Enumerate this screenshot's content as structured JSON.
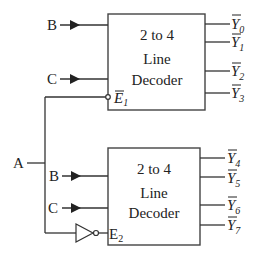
{
  "diagram": {
    "inputs": {
      "A": "A",
      "B_top": "B",
      "C_top": "C",
      "B_bottom": "B",
      "C_bottom": "C"
    },
    "decoder_top": {
      "line1": "2  to 4",
      "line2": "Line",
      "line3": "Decoder",
      "enable_label": "E",
      "enable_sub": "1",
      "enable_active_low": true,
      "outputs": [
        {
          "name": "Y",
          "sub": "0",
          "bar": true
        },
        {
          "name": "Y",
          "sub": "1",
          "bar": true
        },
        {
          "name": "Y",
          "sub": "2",
          "bar": true
        },
        {
          "name": "Y",
          "sub": "3",
          "bar": true
        }
      ]
    },
    "decoder_bottom": {
      "line1": "2  to 4",
      "line2": "Line",
      "line3": "Decoder",
      "enable_label": "E",
      "enable_sub": "2",
      "enable_active_low": false,
      "outputs": [
        {
          "name": "Y",
          "sub": "4",
          "bar": true
        },
        {
          "name": "Y",
          "sub": "5",
          "bar": true
        },
        {
          "name": "Y",
          "sub": "6",
          "bar": true
        },
        {
          "name": "Y",
          "sub": "7",
          "bar": true
        }
      ]
    },
    "colors": {
      "line": "#333333",
      "background": "#ffffff"
    }
  }
}
